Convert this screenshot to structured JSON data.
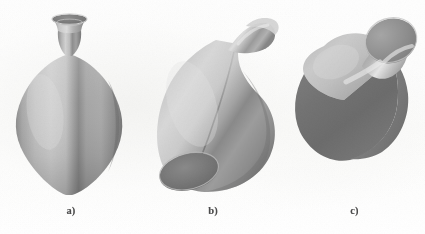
{
  "figure": {
    "background_color": "#fdfdfd",
    "panels": [
      {
        "id": "a",
        "caption": "a)",
        "object_name": "vase-upright",
        "description": "Upright symmetric vase with flared neck, bulbous diamond-shaped body and pointed base",
        "highlight_color": "#e2e2e2",
        "midtone_color": "#a9a9a9",
        "shadow_color": "#6e6e6e",
        "opening_color": "#777777"
      },
      {
        "id": "b",
        "caption": "b)",
        "object_name": "vase-bent",
        "description": "Bent and sheared vase leaning to the right, base opening tilted toward the viewer",
        "highlight_color": "#dedede",
        "midtone_color": "#a5a5a5",
        "shadow_color": "#6a6a6a",
        "opening_color": "#707070"
      },
      {
        "id": "c",
        "caption": "c)",
        "object_name": "vase-rotated-faceted",
        "description": "Rotated and flattened vase with faceted angular body and a conical spout at the upper right",
        "highlight_color": "#dcdcdc",
        "midtone_color": "#9e9e9e",
        "shadow_color": "#676767",
        "opening_color": "#6d6d6d"
      }
    ]
  }
}
